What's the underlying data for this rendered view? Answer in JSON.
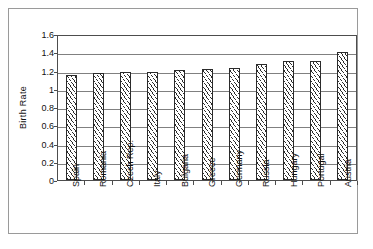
{
  "chart_data": {
    "type": "bar",
    "title": "",
    "xlabel": "",
    "ylabel": "Birth Rate",
    "ylim": [
      0,
      1.6
    ],
    "ytick_values": [
      0,
      0.2,
      0.4,
      0.6,
      0.8,
      1,
      1.2,
      1.4,
      1.6
    ],
    "ytick_labels": [
      "0",
      "0.2",
      "0.4",
      "0.6",
      "0.8",
      "1",
      "1.2",
      "1.4",
      "1.6"
    ],
    "grid": true,
    "legend": false,
    "categories": [
      "Spain",
      "Romania",
      "Czech Rep.",
      "Italy",
      "Bulgaria",
      "Greece",
      "Germany",
      "Russia",
      "Hungary",
      "Portugal",
      "Austria"
    ],
    "values": [
      1.15,
      1.17,
      1.18,
      1.18,
      1.21,
      1.22,
      1.23,
      1.27,
      1.3,
      1.3,
      1.4
    ],
    "bar_fill": "#ffffff",
    "bar_edge": "#2b2b2b",
    "bar_pattern": "diagonal-hatch",
    "axis_color": "#4d4d4d",
    "grid_color": "#808080",
    "plot_background": "#ffffff",
    "frame_border": "#9a9a9a"
  }
}
